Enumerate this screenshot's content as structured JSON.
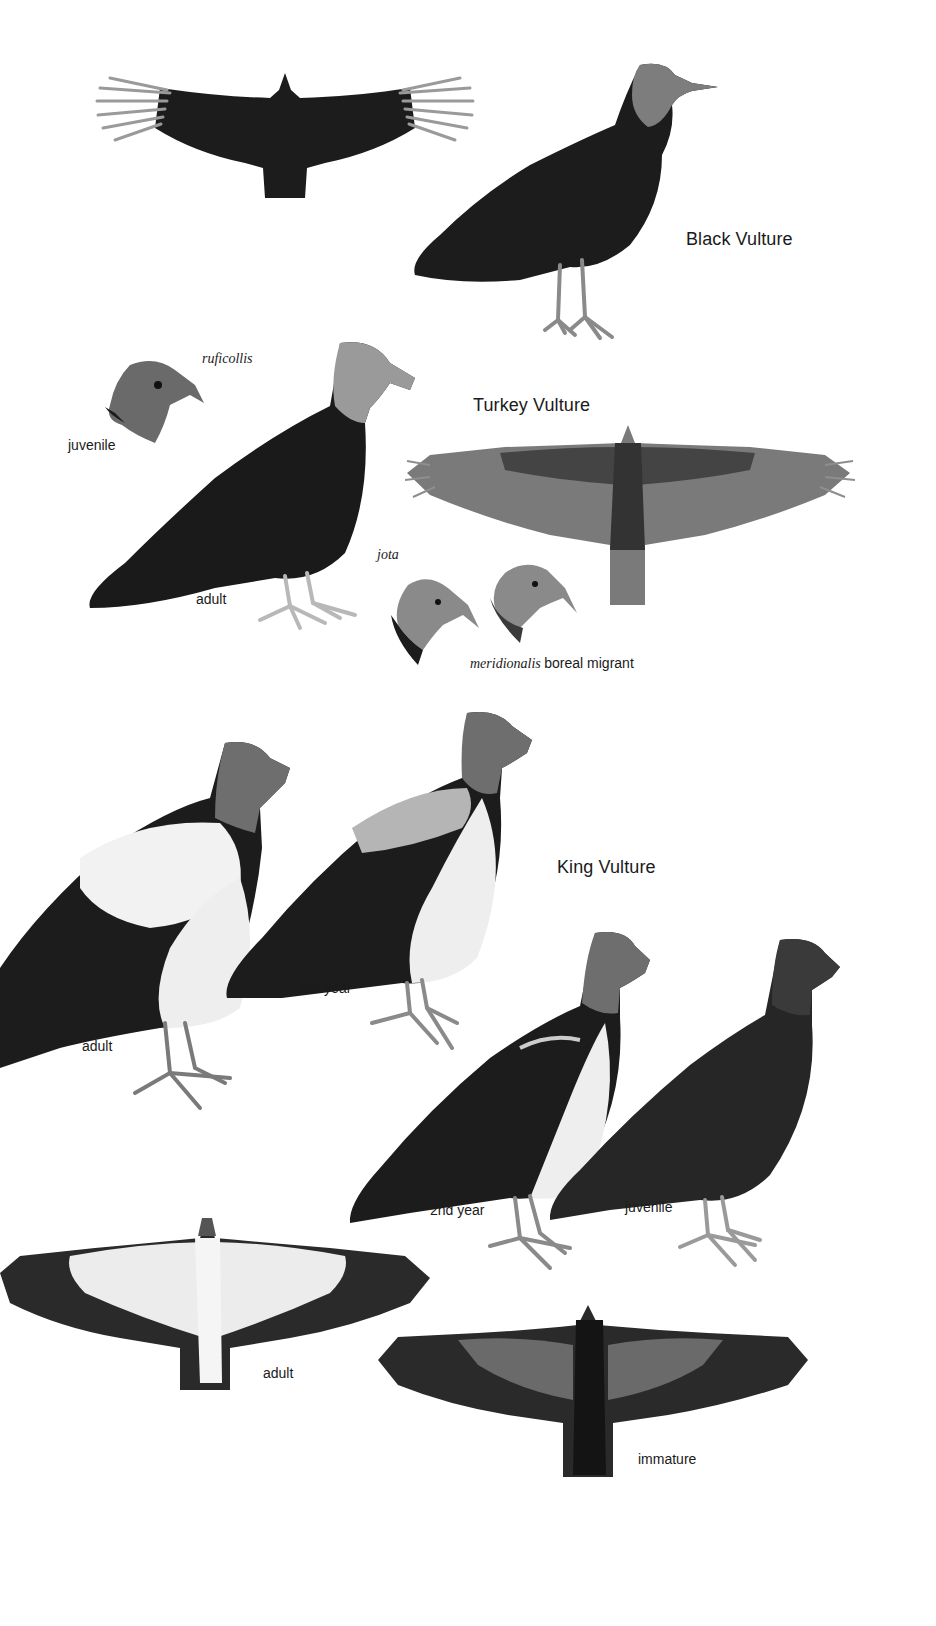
{
  "plate": {
    "species": [
      {
        "name": "Black Vulture",
        "figures": [
          {
            "id": "black-vulture-flight",
            "view": "flight-dorsal",
            "label": ""
          },
          {
            "id": "black-vulture-perched",
            "view": "perched",
            "label": ""
          }
        ]
      },
      {
        "name": "Turkey Vulture",
        "figures": [
          {
            "id": "turkey-vulture-ruficollis-juvenile-head",
            "view": "head",
            "subspecies": "ruficollis",
            "label": "juvenile"
          },
          {
            "id": "turkey-vulture-ruficollis-adult",
            "view": "perched",
            "subspecies": "ruficollis",
            "label": "adult"
          },
          {
            "id": "turkey-vulture-flight",
            "view": "flight-ventral",
            "label": ""
          },
          {
            "id": "turkey-vulture-jota-head",
            "view": "head",
            "subspecies": "jota",
            "label": ""
          },
          {
            "id": "turkey-vulture-meridionalis-head",
            "view": "head",
            "subspecies": "meridionalis",
            "label": "boreal migrant"
          }
        ]
      },
      {
        "name": "King Vulture",
        "figures": [
          {
            "id": "king-vulture-adult-perched",
            "view": "perched",
            "label": "adult"
          },
          {
            "id": "king-vulture-3rd-year",
            "view": "perched",
            "label": "3rd year"
          },
          {
            "id": "king-vulture-2nd-year",
            "view": "perched",
            "label": "2nd year"
          },
          {
            "id": "king-vulture-juvenile",
            "view": "perched",
            "label": "juvenile"
          },
          {
            "id": "king-vulture-adult-flight",
            "view": "flight-ventral",
            "label": "adult"
          },
          {
            "id": "king-vulture-immature-flight",
            "view": "flight-ventral",
            "label": "immature"
          }
        ]
      }
    ]
  },
  "labels": {
    "black_vulture": "Black Vulture",
    "turkey_vulture": "Turkey Vulture",
    "king_vulture": "King Vulture",
    "ruficollis": "ruficollis",
    "juvenile_tv": "juvenile",
    "adult_tv": "adult",
    "jota": "jota",
    "meridionalis": "meridionalis",
    "boreal_migrant": "boreal migrant",
    "king_adult": "adult",
    "king_3rd_year": "3rd year",
    "king_2nd_year": "2nd year",
    "king_juvenile": "juvenile",
    "king_flight_adult": "adult",
    "king_flight_immature": "immature"
  },
  "colors": {
    "background": "#ffffff",
    "text": "#1a1a1a",
    "black_plumage": "#1c1c1c",
    "turkey_flight_gray": "#6e6e6e",
    "head_gray": "#9a9a9a",
    "white_plumage": "#f2f2f2"
  }
}
